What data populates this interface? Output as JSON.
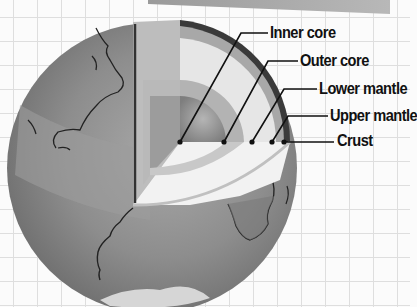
{
  "layers": [
    {
      "id": "inner-core",
      "label": "Inner core"
    },
    {
      "id": "outer-core",
      "label": "Outer core"
    },
    {
      "id": "lower-mantle",
      "label": "Lower mantle"
    },
    {
      "id": "upper-mantle",
      "label": "Upper mantle"
    },
    {
      "id": "crust",
      "label": "Crust"
    }
  ],
  "colors": {
    "background": "#fbfbfb",
    "grid": "#dedede",
    "globe": "#8a8a8a",
    "inner_core": "#8f8f8f",
    "outer_core": "#b3b3b3",
    "lower_mantle": "#e6e6e6",
    "upper_mantle": "#a8a8a8",
    "crust": "#3a3a3a",
    "leader_line": "#111111"
  }
}
